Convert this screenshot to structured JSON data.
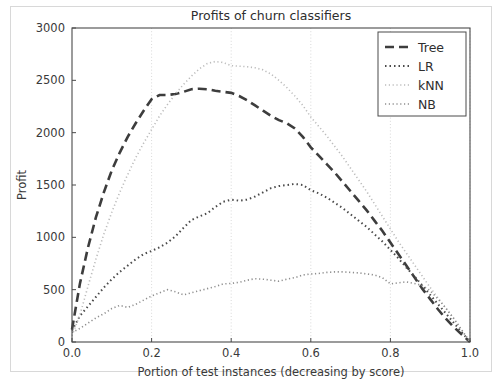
{
  "chart_data": {
    "type": "line",
    "title": "Profits of churn classifiers",
    "xlabel": "Portion of test instances (decreasing by score)",
    "ylabel": "Profit",
    "xlim": [
      0.0,
      1.0
    ],
    "ylim": [
      0,
      3000
    ],
    "xticks": [
      0.0,
      0.2,
      0.4,
      0.6,
      0.8,
      1.0
    ],
    "xticklabels": [
      "0.0",
      "0.2",
      "0.4",
      "0.6",
      "0.8",
      "1.0"
    ],
    "yticks": [
      0,
      500,
      1000,
      1500,
      2000,
      2500,
      3000
    ],
    "yticklabels": [
      "0",
      "500",
      "1000",
      "1500",
      "2000",
      "2500",
      "3000"
    ],
    "grid": true,
    "legend_position": "upper right",
    "x": [
      0.0,
      0.02,
      0.04,
      0.06,
      0.08,
      0.1,
      0.12,
      0.14,
      0.16,
      0.18,
      0.2,
      0.22,
      0.24,
      0.26,
      0.28,
      0.3,
      0.32,
      0.34,
      0.36,
      0.38,
      0.4,
      0.42,
      0.44,
      0.46,
      0.48,
      0.5,
      0.52,
      0.54,
      0.56,
      0.58,
      0.6,
      0.62,
      0.64,
      0.66,
      0.68,
      0.7,
      0.72,
      0.74,
      0.76,
      0.78,
      0.8,
      0.82,
      0.84,
      0.86,
      0.88,
      0.9,
      0.92,
      0.94,
      0.96,
      0.98,
      1.0
    ],
    "series": [
      {
        "name": "Tree",
        "style": "dashed",
        "color": "#3d3d3d",
        "values": [
          120,
          560,
          900,
          1190,
          1430,
          1640,
          1810,
          1960,
          2090,
          2210,
          2320,
          2360,
          2360,
          2370,
          2390,
          2415,
          2420,
          2415,
          2400,
          2390,
          2380,
          2350,
          2310,
          2260,
          2210,
          2160,
          2120,
          2090,
          2040,
          1960,
          1860,
          1780,
          1700,
          1620,
          1530,
          1440,
          1350,
          1260,
          1160,
          1060,
          950,
          840,
          730,
          620,
          510,
          410,
          310,
          220,
          140,
          70,
          0
        ]
      },
      {
        "name": "LR",
        "style": "dashdot",
        "color": "#4a4a4a",
        "values": [
          110,
          250,
          340,
          430,
          520,
          600,
          670,
          730,
          790,
          840,
          870,
          905,
          950,
          1010,
          1090,
          1165,
          1200,
          1230,
          1290,
          1340,
          1360,
          1350,
          1360,
          1390,
          1430,
          1470,
          1490,
          1500,
          1510,
          1500,
          1450,
          1420,
          1380,
          1330,
          1280,
          1220,
          1160,
          1100,
          1030,
          960,
          880,
          800,
          710,
          630,
          540,
          450,
          360,
          270,
          180,
          90,
          0
        ]
      },
      {
        "name": "kNN",
        "style": "dotted",
        "color": "#bcbcbc",
        "values": [
          60,
          260,
          530,
          790,
          1030,
          1240,
          1430,
          1600,
          1760,
          1900,
          2030,
          2160,
          2270,
          2370,
          2460,
          2540,
          2610,
          2660,
          2680,
          2670,
          2640,
          2635,
          2630,
          2620,
          2600,
          2560,
          2500,
          2430,
          2350,
          2260,
          2150,
          2060,
          1970,
          1870,
          1770,
          1660,
          1550,
          1440,
          1320,
          1200,
          1080,
          960,
          850,
          740,
          630,
          520,
          420,
          320,
          220,
          110,
          0
        ]
      },
      {
        "name": "NB",
        "style": "dotted",
        "color": "#8e8e8e",
        "values": [
          90,
          130,
          180,
          230,
          270,
          320,
          350,
          330,
          360,
          400,
          440,
          470,
          500,
          480,
          450,
          470,
          490,
          510,
          530,
          555,
          560,
          570,
          590,
          605,
          600,
          590,
          580,
          600,
          615,
          640,
          650,
          655,
          665,
          670,
          670,
          665,
          660,
          650,
          640,
          615,
          555,
          565,
          575,
          560,
          540,
          490,
          410,
          320,
          220,
          110,
          0
        ]
      }
    ]
  },
  "legend": {
    "entries": [
      {
        "label": "Tree"
      },
      {
        "label": "LR"
      },
      {
        "label": "kNN"
      },
      {
        "label": "NB"
      }
    ]
  }
}
